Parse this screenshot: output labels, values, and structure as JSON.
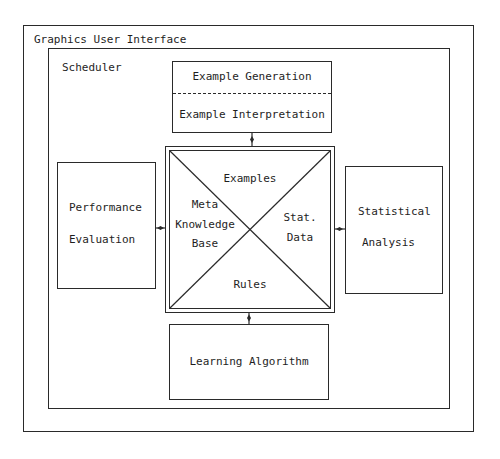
{
  "diagram": {
    "outer": {
      "title": "Graphics User Interface"
    },
    "scheduler": {
      "title": "Scheduler"
    },
    "example_box": {
      "top_label": "Example Generation",
      "bottom_label": "Example Interpretation"
    },
    "knowledge_base": {
      "top": "Examples",
      "left_lines": [
        "Meta",
        "Knowledge",
        "Base"
      ],
      "right_lines": [
        "Stat.",
        "Data"
      ],
      "bottom": "Rules"
    },
    "performance_box": {
      "lines": [
        "Performance",
        "Evaluation"
      ]
    },
    "statistical_box": {
      "lines": [
        "Statistical",
        "Analysis"
      ]
    },
    "learning_box": {
      "label": "Learning Algorithm"
    },
    "connections": [
      {
        "from": "Example Generation/Interpretation",
        "to": "Knowledge Base"
      },
      {
        "from": "Performance Evaluation",
        "to": "Knowledge Base"
      },
      {
        "from": "Statistical Analysis",
        "to": "Knowledge Base"
      },
      {
        "from": "Learning Algorithm",
        "to": "Knowledge Base"
      }
    ],
    "line_color": "#2a2a2a"
  }
}
